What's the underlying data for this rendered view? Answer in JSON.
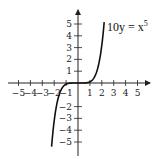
{
  "chart_data": {
    "type": "line",
    "title": "",
    "xlabel": "",
    "ylabel": "",
    "xlim": [
      -5.5,
      5.8
    ],
    "ylim": [
      -5.8,
      5.8
    ],
    "grid": false,
    "x_ticks": [
      -5,
      -4,
      -3,
      -2,
      -1,
      1,
      2,
      3,
      4,
      5
    ],
    "y_ticks": [
      5,
      4,
      3,
      2,
      1,
      -2,
      -3,
      -4,
      -5
    ],
    "series": [
      {
        "name": "10y = x^5",
        "equation": "10y = x^5",
        "function": "y = x^5 / 10",
        "x": [
          -2.2,
          -2.0,
          -1.8,
          -1.6,
          -1.4,
          -1.2,
          -1.0,
          -0.8,
          -0.5,
          0,
          0.5,
          0.8,
          1.0,
          1.2,
          1.4,
          1.6,
          1.8,
          2.0,
          2.2
        ],
        "values": [
          -5.15,
          -3.2,
          -1.89,
          -1.05,
          -0.54,
          -0.25,
          -0.1,
          -0.03,
          -0.003,
          0,
          0.003,
          0.03,
          0.1,
          0.25,
          0.54,
          1.05,
          1.89,
          3.2,
          5.15
        ]
      }
    ],
    "annotations": [
      {
        "text_main": "10y = x",
        "text_sup": "5",
        "position": "upper right of curve"
      }
    ]
  },
  "labels": {
    "x_ticks": [
      "−5",
      "−4",
      "−3",
      "−2",
      "−1",
      "1",
      "2",
      "3",
      "4",
      "5"
    ],
    "y_ticks_pos": [
      "5",
      "4",
      "3",
      "2",
      "1"
    ],
    "y_ticks_neg": [
      "−2",
      "−3",
      "−4",
      "−5"
    ],
    "eq_main": "10y = x",
    "eq_sup": "5"
  }
}
